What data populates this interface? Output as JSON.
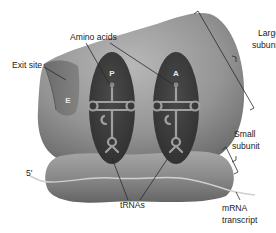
{
  "figure": {
    "colors": {
      "background": "#ffffff",
      "large_subunit": "#8e8e8e",
      "large_subunit_highlight": "#b4b4b4",
      "small_subunit": "#7e7e7e",
      "small_subunit_highlight": "#a9a9a9",
      "tunnel": "#3a3a3a",
      "trna": "#9a9a9a",
      "mrna": "#c8c8c8",
      "label_text": "#222222",
      "site_letter": "#e8e8e8"
    }
  },
  "structures": {
    "large_subunit": {
      "label_line1": "Large",
      "label_line2": "subunit"
    },
    "small_subunit": {
      "label_line1": "Small",
      "label_line2": "subunit"
    },
    "mrna": {
      "label_line1": "mRNA",
      "label_line2": "transcript",
      "end_label": "5'"
    }
  },
  "sites": {
    "exit": {
      "letter": "E",
      "label": "Exit site"
    },
    "p": {
      "letter": "P"
    },
    "a": {
      "letter": "A"
    }
  },
  "labels": {
    "amino_acids": "Amino acids",
    "trnas": "tRNAs"
  }
}
